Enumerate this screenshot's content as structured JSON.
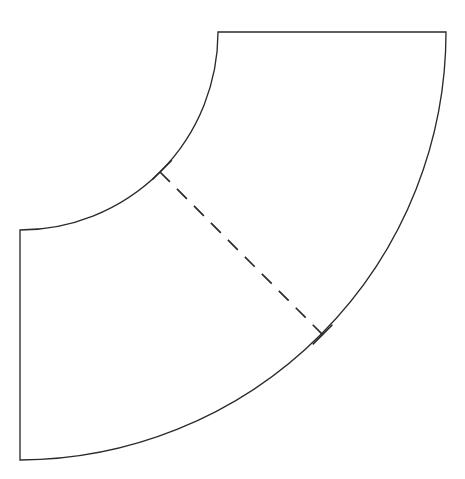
{
  "figure": {
    "background_color": "#ffffff",
    "stroke_color": "#2b2b2b",
    "canvas": {
      "width": 465,
      "height": 479
    }
  },
  "geometry": {
    "center": {
      "x": 20,
      "y": 32
    },
    "inner_radius": 198,
    "outer_radius": 428,
    "sweep_start_angle_deg": 0,
    "sweep_end_angle_deg": 90,
    "inner_arc_start": {
      "x": 218,
      "y": 32
    },
    "inner_arc_end": {
      "x": 20,
      "y": 230
    },
    "outer_arc_start": {
      "x": 446,
      "y": 32
    },
    "outer_arc_end": {
      "x": 20,
      "y": 460
    },
    "top_edge_start": {
      "x": 218,
      "y": 32
    },
    "top_edge_end": {
      "x": 446,
      "y": 32
    },
    "left_edge_start": {
      "x": 20,
      "y": 230
    },
    "left_edge_end": {
      "x": 20,
      "y": 460
    },
    "radial_angle_deg": 45,
    "radial_inner_point": {
      "x": 160.0,
      "y": 172.0
    },
    "radial_outer_point": {
      "x": 322.6,
      "y": 334.6
    }
  },
  "paths": {
    "outline": "M 218 32 L 446 32 A 428 428 0 0 1 20 460 L 20 230 A 198 198 0 0 0 218 32 Z",
    "radial_dashed": "M 160.0 172.0 L 322.6 334.6",
    "tick_inner": "M 152.2 179.8 L 171.8 160.2",
    "tick_outer": "M 312.8 344.4 L 332.4 324.8"
  },
  "style": {
    "outline_stroke_width": 1.35,
    "dashed_stroke_width": 1.7,
    "dash_pattern": "14 10",
    "tick_stroke_width": 1.6,
    "tick_length": 28
  },
  "elements": {
    "inner_arc_name": "inner-arc",
    "outer_arc_name": "outer-arc",
    "top_edge_name": "top-straight-edge",
    "left_edge_name": "left-straight-edge",
    "dashed_name": "dashed-radial-line",
    "tick_inner_name": "tick-inner-endpoint",
    "tick_outer_name": "tick-outer-endpoint"
  }
}
